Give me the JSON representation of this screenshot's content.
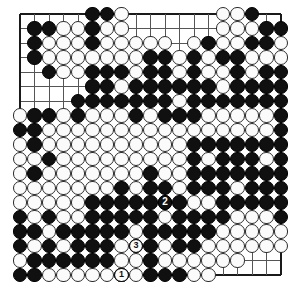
{
  "diagram": {
    "name": "go-board-diagram",
    "board_size": 19,
    "colors": {
      "background": "#ffffff",
      "grid_line": "#555555",
      "border_line": "#1a1a1a",
      "black_stone": "#101010",
      "white_stone": "#fbfbfb",
      "white_stone_border": "#2b2b2b"
    },
    "geometry": {
      "origin_x": 20,
      "origin_y": 14,
      "cell": 14.5,
      "stone_diameter": 14.2
    },
    "star_points": [
      [
        3,
        3
      ],
      [
        9,
        3
      ],
      [
        15,
        3
      ],
      [
        3,
        9
      ],
      [
        9,
        9
      ],
      [
        15,
        9
      ],
      [
        3,
        15
      ],
      [
        9,
        15
      ],
      [
        15,
        15
      ]
    ],
    "black_stones": [
      [
        5,
        0
      ],
      [
        6,
        0
      ],
      [
        16,
        0
      ],
      [
        1,
        1
      ],
      [
        2,
        1
      ],
      [
        5,
        1
      ],
      [
        17,
        1
      ],
      [
        18,
        1
      ],
      [
        1,
        2
      ],
      [
        5,
        2
      ],
      [
        13,
        2
      ],
      [
        16,
        2
      ],
      [
        17,
        2
      ],
      [
        1,
        3
      ],
      [
        9,
        3
      ],
      [
        10,
        3
      ],
      [
        12,
        3
      ],
      [
        14,
        3
      ],
      [
        15,
        3
      ],
      [
        2,
        4
      ],
      [
        5,
        4
      ],
      [
        6,
        4
      ],
      [
        7,
        4
      ],
      [
        9,
        4
      ],
      [
        10,
        4
      ],
      [
        12,
        4
      ],
      [
        15,
        4
      ],
      [
        17,
        4
      ],
      [
        18,
        4
      ],
      [
        5,
        5
      ],
      [
        6,
        5
      ],
      [
        8,
        5
      ],
      [
        9,
        5
      ],
      [
        10,
        5
      ],
      [
        11,
        5
      ],
      [
        12,
        5
      ],
      [
        13,
        5
      ],
      [
        15,
        5
      ],
      [
        16,
        5
      ],
      [
        17,
        5
      ],
      [
        18,
        5
      ],
      [
        4,
        6
      ],
      [
        5,
        6
      ],
      [
        6,
        6
      ],
      [
        7,
        6
      ],
      [
        8,
        6
      ],
      [
        9,
        6
      ],
      [
        10,
        6
      ],
      [
        12,
        6
      ],
      [
        13,
        6
      ],
      [
        14,
        6
      ],
      [
        15,
        6
      ],
      [
        16,
        6
      ],
      [
        17,
        6
      ],
      [
        18,
        6
      ],
      [
        1,
        7
      ],
      [
        2,
        7
      ],
      [
        4,
        7
      ],
      [
        8,
        7
      ],
      [
        10,
        7
      ],
      [
        11,
        7
      ],
      [
        12,
        7
      ],
      [
        18,
        7
      ],
      [
        0,
        8
      ],
      [
        1,
        8
      ],
      [
        18,
        8
      ],
      [
        1,
        9
      ],
      [
        12,
        9
      ],
      [
        13,
        9
      ],
      [
        14,
        9
      ],
      [
        15,
        9
      ],
      [
        16,
        9
      ],
      [
        17,
        9
      ],
      [
        18,
        9
      ],
      [
        2,
        10
      ],
      [
        12,
        10
      ],
      [
        14,
        10
      ],
      [
        15,
        10
      ],
      [
        16,
        10
      ],
      [
        18,
        10
      ],
      [
        1,
        11
      ],
      [
        9,
        11
      ],
      [
        12,
        11
      ],
      [
        13,
        11
      ],
      [
        14,
        11
      ],
      [
        15,
        11
      ],
      [
        16,
        11
      ],
      [
        17,
        11
      ],
      [
        18,
        11
      ],
      [
        7,
        12
      ],
      [
        9,
        12
      ],
      [
        10,
        12
      ],
      [
        12,
        12
      ],
      [
        13,
        12
      ],
      [
        14,
        12
      ],
      [
        16,
        12
      ],
      [
        17,
        12
      ],
      [
        18,
        12
      ],
      [
        5,
        13
      ],
      [
        6,
        13
      ],
      [
        7,
        13
      ],
      [
        8,
        13
      ],
      [
        9,
        13
      ],
      [
        10,
        13
      ],
      [
        11,
        13
      ],
      [
        14,
        13
      ],
      [
        15,
        13
      ],
      [
        16,
        13
      ],
      [
        17,
        13
      ],
      [
        18,
        13
      ],
      [
        0,
        14
      ],
      [
        2,
        14
      ],
      [
        5,
        14
      ],
      [
        6,
        14
      ],
      [
        7,
        14
      ],
      [
        8,
        14
      ],
      [
        9,
        14
      ],
      [
        11,
        14
      ],
      [
        12,
        14
      ],
      [
        13,
        14
      ],
      [
        14,
        14
      ],
      [
        18,
        14
      ],
      [
        0,
        15
      ],
      [
        1,
        15
      ],
      [
        3,
        15
      ],
      [
        4,
        15
      ],
      [
        5,
        15
      ],
      [
        6,
        15
      ],
      [
        7,
        15
      ],
      [
        9,
        15
      ],
      [
        10,
        15
      ],
      [
        11,
        15
      ],
      [
        12,
        15
      ],
      [
        13,
        15
      ],
      [
        0,
        16
      ],
      [
        2,
        16
      ],
      [
        4,
        16
      ],
      [
        5,
        16
      ],
      [
        6,
        16
      ],
      [
        9,
        16
      ],
      [
        11,
        16
      ],
      [
        12,
        16
      ],
      [
        1,
        17
      ],
      [
        2,
        17
      ],
      [
        3,
        17
      ],
      [
        4,
        17
      ],
      [
        5,
        17
      ],
      [
        6,
        17
      ],
      [
        9,
        17
      ],
      [
        0,
        18
      ],
      [
        1,
        18
      ],
      [
        7,
        18
      ],
      [
        9,
        18
      ],
      [
        10,
        18
      ],
      [
        11,
        18
      ]
    ],
    "white_stones": [
      [
        7,
        0
      ],
      [
        14,
        0
      ],
      [
        15,
        0
      ],
      [
        3,
        1
      ],
      [
        4,
        1
      ],
      [
        6,
        1
      ],
      [
        7,
        1
      ],
      [
        14,
        1
      ],
      [
        15,
        1
      ],
      [
        16,
        1
      ],
      [
        2,
        2
      ],
      [
        3,
        2
      ],
      [
        4,
        2
      ],
      [
        6,
        2
      ],
      [
        7,
        2
      ],
      [
        8,
        2
      ],
      [
        9,
        2
      ],
      [
        10,
        2
      ],
      [
        12,
        2
      ],
      [
        14,
        2
      ],
      [
        15,
        2
      ],
      [
        18,
        2
      ],
      [
        2,
        3
      ],
      [
        3,
        3
      ],
      [
        4,
        3
      ],
      [
        5,
        3
      ],
      [
        6,
        3
      ],
      [
        7,
        3
      ],
      [
        8,
        3
      ],
      [
        11,
        3
      ],
      [
        13,
        3
      ],
      [
        16,
        3
      ],
      [
        17,
        3
      ],
      [
        18,
        3
      ],
      [
        3,
        4
      ],
      [
        4,
        4
      ],
      [
        8,
        4
      ],
      [
        11,
        4
      ],
      [
        13,
        4
      ],
      [
        14,
        4
      ],
      [
        16,
        4
      ],
      [
        7,
        5
      ],
      [
        14,
        5
      ],
      [
        11,
        6
      ],
      [
        0,
        7
      ],
      [
        3,
        7
      ],
      [
        5,
        7
      ],
      [
        6,
        7
      ],
      [
        7,
        7
      ],
      [
        9,
        7
      ],
      [
        13,
        7
      ],
      [
        14,
        7
      ],
      [
        15,
        7
      ],
      [
        16,
        7
      ],
      [
        17,
        7
      ],
      [
        2,
        8
      ],
      [
        3,
        8
      ],
      [
        4,
        8
      ],
      [
        5,
        8
      ],
      [
        6,
        8
      ],
      [
        7,
        8
      ],
      [
        8,
        8
      ],
      [
        9,
        8
      ],
      [
        10,
        8
      ],
      [
        11,
        8
      ],
      [
        12,
        8
      ],
      [
        13,
        8
      ],
      [
        14,
        8
      ],
      [
        15,
        8
      ],
      [
        16,
        8
      ],
      [
        17,
        8
      ],
      [
        0,
        9
      ],
      [
        2,
        9
      ],
      [
        3,
        9
      ],
      [
        4,
        9
      ],
      [
        5,
        9
      ],
      [
        6,
        9
      ],
      [
        7,
        9
      ],
      [
        8,
        9
      ],
      [
        9,
        9
      ],
      [
        10,
        9
      ],
      [
        11,
        9
      ],
      [
        0,
        10
      ],
      [
        1,
        10
      ],
      [
        3,
        10
      ],
      [
        4,
        10
      ],
      [
        5,
        10
      ],
      [
        6,
        10
      ],
      [
        7,
        10
      ],
      [
        8,
        10
      ],
      [
        9,
        10
      ],
      [
        10,
        10
      ],
      [
        11,
        10
      ],
      [
        13,
        10
      ],
      [
        17,
        10
      ],
      [
        0,
        11
      ],
      [
        2,
        11
      ],
      [
        3,
        11
      ],
      [
        4,
        11
      ],
      [
        5,
        11
      ],
      [
        6,
        11
      ],
      [
        7,
        11
      ],
      [
        8,
        11
      ],
      [
        10,
        11
      ],
      [
        11,
        11
      ],
      [
        0,
        12
      ],
      [
        1,
        12
      ],
      [
        2,
        12
      ],
      [
        3,
        12
      ],
      [
        4,
        12
      ],
      [
        5,
        12
      ],
      [
        6,
        12
      ],
      [
        8,
        12
      ],
      [
        11,
        12
      ],
      [
        15,
        12
      ],
      [
        0,
        13
      ],
      [
        1,
        13
      ],
      [
        2,
        13
      ],
      [
        3,
        13
      ],
      [
        4,
        13
      ],
      [
        12,
        13
      ],
      [
        13,
        13
      ],
      [
        1,
        14
      ],
      [
        3,
        14
      ],
      [
        4,
        14
      ],
      [
        10,
        14
      ],
      [
        15,
        14
      ],
      [
        16,
        14
      ],
      [
        17,
        14
      ],
      [
        2,
        15
      ],
      [
        8,
        15
      ],
      [
        14,
        15
      ],
      [
        15,
        15
      ],
      [
        16,
        15
      ],
      [
        17,
        15
      ],
      [
        18,
        15
      ],
      [
        1,
        16
      ],
      [
        3,
        16
      ],
      [
        7,
        16
      ],
      [
        8,
        16
      ],
      [
        10,
        16
      ],
      [
        13,
        16
      ],
      [
        14,
        16
      ],
      [
        15,
        16
      ],
      [
        16,
        16
      ],
      [
        17,
        16
      ],
      [
        18,
        16
      ],
      [
        0,
        17
      ],
      [
        7,
        17
      ],
      [
        8,
        17
      ],
      [
        10,
        17
      ],
      [
        11,
        17
      ],
      [
        12,
        17
      ],
      [
        13,
        17
      ],
      [
        14,
        17
      ],
      [
        15,
        17
      ],
      [
        2,
        18
      ],
      [
        3,
        18
      ],
      [
        4,
        18
      ],
      [
        5,
        18
      ],
      [
        6,
        18
      ],
      [
        8,
        18
      ],
      [
        12,
        18
      ],
      [
        13,
        18
      ]
    ],
    "moves": [
      {
        "number": "1",
        "label": "1",
        "color": "white",
        "col": 7,
        "row": 18,
        "name": "move-1-white"
      },
      {
        "number": "2",
        "label": "2",
        "color": "black",
        "col": 10,
        "row": 13,
        "name": "move-2-black"
      },
      {
        "number": "3",
        "label": "3",
        "color": "white",
        "col": 8,
        "row": 16,
        "name": "move-3-white"
      }
    ]
  }
}
